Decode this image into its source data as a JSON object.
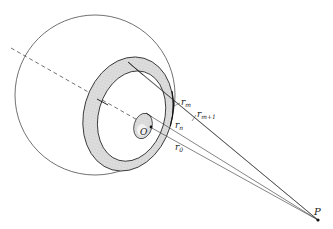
{
  "diagram": {
    "labels": {
      "origin": "O",
      "point": "P",
      "r_m": {
        "base": "r",
        "sub": "m"
      },
      "r_m1": {
        "base": "r",
        "sub": "m+1"
      },
      "r_n": {
        "base": "r",
        "sub": "n"
      },
      "r_0": {
        "base": "r",
        "sub": "0"
      }
    },
    "colors": {
      "stroke": "#222222",
      "ring_fill": "#d9d9d9",
      "background": "#ffffff"
    }
  }
}
